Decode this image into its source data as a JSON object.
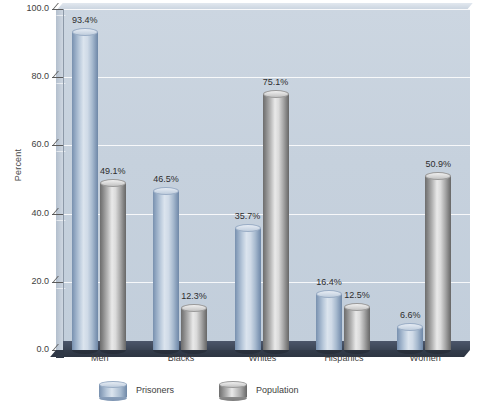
{
  "chart_data": {
    "type": "bar",
    "title": "",
    "xlabel": "",
    "ylabel": "Percent",
    "ylim": [
      0,
      100
    ],
    "ytick_labels": [
      "0.0",
      "20.0",
      "40.0",
      "60.0",
      "80.0",
      "100.0"
    ],
    "ytick_values": [
      0,
      20,
      40,
      60,
      80,
      100
    ],
    "grid": true,
    "legend_position": "bottom",
    "categories": [
      "Men",
      "Blacks",
      "Whites",
      "Hispanics",
      "Women"
    ],
    "series": [
      {
        "name": "Prisoners",
        "color": "#8fa5c0",
        "values": [
          93.4,
          46.5,
          35.7,
          16.4,
          6.6
        ],
        "labels": [
          "93.4%",
          "46.5%",
          "35.7%",
          "16.4%",
          "6.6%"
        ]
      },
      {
        "name": "Population",
        "color": "#a8a8a8",
        "values": [
          49.1,
          12.3,
          75.1,
          12.5,
          50.9
        ],
        "labels": [
          "49.1%",
          "12.3%",
          "75.1%",
          "12.5%",
          "50.9%"
        ]
      }
    ]
  },
  "colors": {
    "plot_background": "#c6d1dd",
    "floor": "#3a4454",
    "gridline": "#ffffff",
    "axis_text": "#3e3e3e",
    "prisoners_accent": "#8fa5c0",
    "population_accent": "#a8a8a8"
  }
}
